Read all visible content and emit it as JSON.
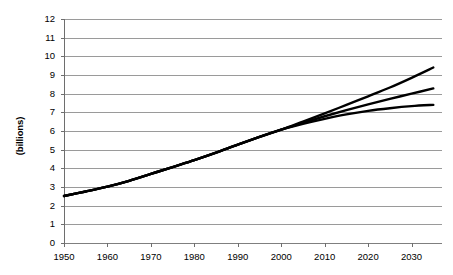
{
  "chart_data": {
    "type": "line",
    "title": "",
    "xlabel": "",
    "ylabel": "(billions)",
    "xlim": [
      1950,
      2037
    ],
    "ylim": [
      0,
      12
    ],
    "grid": true,
    "legend": "none",
    "y_ticks": [
      "0",
      "1",
      "2",
      "3",
      "4",
      "5",
      "6",
      "7",
      "8",
      "9",
      "10",
      "11",
      "12"
    ],
    "x_ticks": [
      "1950",
      "1960",
      "1970",
      "1980",
      "1990",
      "2000",
      "2010",
      "2020",
      "2030"
    ],
    "x": [
      1950,
      1955,
      1960,
      1965,
      1970,
      1975,
      1980,
      1985,
      1990,
      1995,
      2000,
      2005,
      2010,
      2015,
      2020,
      2025,
      2030,
      2035
    ],
    "series": [
      {
        "name": "high variant",
        "color": "#000000",
        "values": [
          2.52,
          2.76,
          3.02,
          3.33,
          3.7,
          4.07,
          4.44,
          4.84,
          5.27,
          5.68,
          6.07,
          6.5,
          6.94,
          7.4,
          7.86,
          8.33,
          8.85,
          9.4
        ]
      },
      {
        "name": "medium variant",
        "color": "#000000",
        "values": [
          2.52,
          2.76,
          3.02,
          3.33,
          3.7,
          4.07,
          4.44,
          4.84,
          5.27,
          5.68,
          6.07,
          6.44,
          6.79,
          7.12,
          7.43,
          7.72,
          8.0,
          8.28
        ]
      },
      {
        "name": "low variant",
        "color": "#000000",
        "values": [
          2.52,
          2.76,
          3.02,
          3.33,
          3.7,
          4.07,
          4.44,
          4.84,
          5.27,
          5.68,
          6.07,
          6.38,
          6.65,
          6.89,
          7.08,
          7.22,
          7.33,
          7.4
        ]
      }
    ]
  }
}
